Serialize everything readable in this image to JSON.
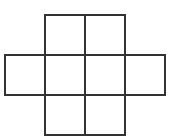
{
  "diagram": {
    "type": "grid-net",
    "cell_size": 40,
    "line_color": "#333333",
    "line_width": 2,
    "background": "#ffffff",
    "origin": {
      "x": 5,
      "y": 15
    },
    "rows": [
      {
        "row": 0,
        "cols": [
          1,
          2
        ]
      },
      {
        "row": 1,
        "cols": [
          0,
          1,
          2,
          3
        ]
      },
      {
        "row": 2,
        "cols": [
          1,
          2
        ]
      }
    ],
    "cells": [
      {
        "row": 0,
        "col": 1
      },
      {
        "row": 0,
        "col": 2
      },
      {
        "row": 1,
        "col": 0
      },
      {
        "row": 1,
        "col": 1
      },
      {
        "row": 1,
        "col": 2
      },
      {
        "row": 1,
        "col": 3
      },
      {
        "row": 2,
        "col": 1
      },
      {
        "row": 2,
        "col": 2
      }
    ]
  }
}
